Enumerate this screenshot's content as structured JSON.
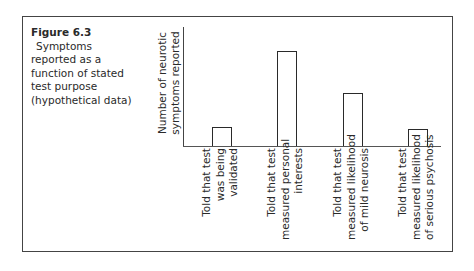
{
  "figure": {
    "number": "Figure 6.3",
    "caption": "Symptoms reported as a function of stated test purpose (hypothetical data)",
    "caption_lines": [
      "Symptoms",
      "reported as a",
      "function of stated",
      "test purpose",
      "(hypothetical data)"
    ]
  },
  "chart_data": {
    "type": "bar",
    "title": "Symptoms reported as a function of stated test purpose (hypothetical data)",
    "xlabel": "",
    "ylabel": "Number of neurotic symptoms reported",
    "ylabel_lines": [
      "Number of neurotic",
      "symptoms reported"
    ],
    "categories": [
      "Told that test was being validated",
      "Told that test measured personal interests",
      "Told that test measured likelihood of mild neurosis",
      "Told that test measured likelihood of serious psychosis"
    ],
    "category_lines": [
      [
        "Told that test",
        "was being",
        "validated"
      ],
      [
        "Told that test",
        "measured personal",
        "interests"
      ],
      [
        "Told that test",
        "measured likelihood",
        "of mild neurosis"
      ],
      [
        "Told that test",
        "measured likelihood",
        "of serious psychosis"
      ]
    ],
    "values": [
      19,
      95,
      53,
      17
    ],
    "ylim": [
      0,
      100
    ],
    "y_ticks": "none",
    "grid": false,
    "legend": "none",
    "bar_fill": "#ffffff",
    "bar_edge": "#2a2a2a"
  }
}
